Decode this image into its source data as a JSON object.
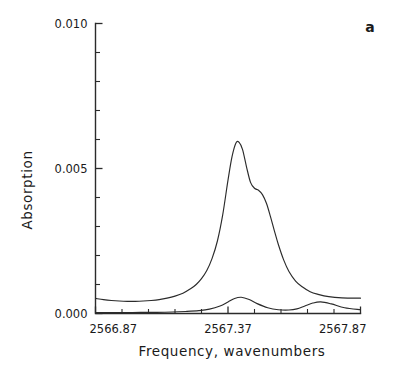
{
  "figure": {
    "panel_label": "a",
    "background_color": "#ffffff",
    "line_color": "#2b2b2b"
  },
  "chart_data": {
    "type": "line",
    "title": "",
    "subtitle": "",
    "xlabel": "Frequency,  wavenumbers",
    "ylabel": "Absorption",
    "xlim": [
      2566.87,
      2567.87
    ],
    "ylim": [
      0.0,
      0.01
    ],
    "grid": false,
    "legend": null,
    "annotations": [
      {
        "text": "a",
        "position": "top-right"
      }
    ],
    "x_tick_labels": [
      "2566.87",
      "2567.37",
      "2567.87"
    ],
    "x_tick_values": [
      2566.87,
      2567.37,
      2567.87
    ],
    "x_minor_tick_count": 10,
    "y_tick_labels": [
      "0.000",
      "0.005",
      "0.010"
    ],
    "y_tick_values": [
      0.0,
      0.005,
      0.01
    ],
    "y_minor_tick_count": 10,
    "series": [
      {
        "name": "absorption-trace",
        "description": "main absorption band with right shoulder",
        "x": [
          2566.87,
          2566.9,
          2566.93,
          2566.96,
          2566.99,
          2567.02,
          2567.05,
          2567.08,
          2567.11,
          2567.14,
          2567.17,
          2567.2,
          2567.23,
          2567.25,
          2567.27,
          2567.29,
          2567.31,
          2567.33,
          2567.35,
          2567.37,
          2567.385,
          2567.4,
          2567.412,
          2567.425,
          2567.44,
          2567.455,
          2567.47,
          2567.485,
          2567.5,
          2567.515,
          2567.53,
          2567.545,
          2567.56,
          2567.58,
          2567.6,
          2567.625,
          2567.65,
          2567.68,
          2567.71,
          2567.75,
          2567.8,
          2567.87
        ],
        "y": [
          0.00052,
          0.00048,
          0.00045,
          0.00043,
          0.00042,
          0.00042,
          0.00043,
          0.00045,
          0.00048,
          0.00053,
          0.0006,
          0.0007,
          0.00086,
          0.001,
          0.0012,
          0.00148,
          0.0019,
          0.0025,
          0.0034,
          0.0046,
          0.0054,
          0.00588,
          0.0059,
          0.00565,
          0.00505,
          0.00452,
          0.00432,
          0.00425,
          0.0041,
          0.0038,
          0.00335,
          0.00285,
          0.00238,
          0.00185,
          0.00145,
          0.00112,
          0.00092,
          0.00075,
          0.00066,
          0.00058,
          0.00054,
          0.00053
        ]
      },
      {
        "name": "residual-trace",
        "description": "lower baseline trace with two weak bumps",
        "x": [
          2566.87,
          2566.92,
          2566.98,
          2567.04,
          2567.1,
          2567.16,
          2567.21,
          2567.26,
          2567.3,
          2567.34,
          2567.37,
          2567.395,
          2567.42,
          2567.45,
          2567.48,
          2567.52,
          2567.56,
          2567.6,
          2567.63,
          2567.66,
          2567.69,
          2567.72,
          2567.76,
          2567.81,
          2567.87
        ],
        "y": [
          3e-05,
          3e-05,
          3e-05,
          4e-05,
          4e-05,
          5e-05,
          7e-05,
          0.0001,
          0.00015,
          0.00026,
          0.0004,
          0.00052,
          0.00056,
          0.00048,
          0.00034,
          0.0002,
          0.00013,
          0.00012,
          0.00016,
          0.00026,
          0.00036,
          0.0004,
          0.00033,
          0.0002,
          0.00013
        ]
      }
    ]
  }
}
